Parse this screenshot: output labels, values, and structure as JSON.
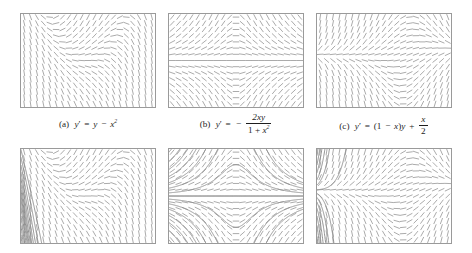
{
  "figure": {
    "background": "#ffffff",
    "panel_border_color": "#9a9a9a",
    "slope_mark_color": "#8c8c8c",
    "solution_curve_color": "#8a8a8a",
    "caption_color": "#1d1d1d",
    "rows": 2,
    "columns": 3
  },
  "panels": [
    {
      "id": "panel-a-field",
      "row": 1,
      "column": 1,
      "label": "(a)",
      "equation_text": "y' = y - x^2",
      "ode": "y-x*x",
      "show_curves": false,
      "x_range": [
        -3,
        3
      ],
      "y_range": [
        -3,
        3
      ],
      "grid": [
        21,
        15
      ]
    },
    {
      "id": "panel-b-field",
      "row": 1,
      "column": 2,
      "label": "(b)",
      "equation_text": "y' = - 2xy / (1 + x^2)",
      "ode": "-2*x*y/(1+x*x)",
      "show_curves": false,
      "x_range": [
        -3,
        3
      ],
      "y_range": [
        -3,
        3
      ],
      "grid": [
        21,
        15
      ]
    },
    {
      "id": "panel-c-field",
      "row": 1,
      "column": 3,
      "label": "(c)",
      "equation_text": "y' = (1 - x)y + x/2",
      "ode": "(1-x)*y+x/2",
      "show_curves": false,
      "x_range": [
        -3,
        3
      ],
      "y_range": [
        -3,
        3
      ],
      "grid": [
        21,
        15
      ]
    },
    {
      "id": "panel-d-curves",
      "row": 2,
      "column": 1,
      "label": "",
      "equation_text": "y' = y - x^2",
      "ode": "y-x*x",
      "show_curves": true,
      "x_range": [
        -3,
        3
      ],
      "y_range": [
        -3,
        3
      ],
      "grid": [
        21,
        15
      ],
      "curve_seeds": [
        2.95,
        2.45,
        1.95,
        1.5,
        1.1,
        0.7,
        0.35,
        0.05,
        -0.3,
        -0.75,
        -1.3,
        -1.9,
        -2.5
      ]
    },
    {
      "id": "panel-e-curves",
      "row": 2,
      "column": 2,
      "label": "",
      "equation_text": "y' = - 2xy / (1 + x^2)",
      "ode": "-2*x*y/(1+x*x)",
      "show_curves": true,
      "x_range": [
        -3,
        3
      ],
      "y_range": [
        -3,
        3
      ],
      "grid": [
        21,
        15
      ],
      "curve_seeds": [
        2.8,
        2.2,
        1.7,
        1.25,
        0.85,
        0.5,
        0.2,
        0.0,
        -0.2,
        -0.5,
        -0.85,
        -1.25,
        -1.7,
        -2.2,
        -2.8
      ]
    },
    {
      "id": "panel-f-curves",
      "row": 2,
      "column": 3,
      "label": "",
      "equation_text": "y' = (1 - x)y + x/2",
      "ode": "(1-x)*y+x/2",
      "show_curves": true,
      "x_range": [
        -3,
        3
      ],
      "y_range": [
        -3,
        3
      ],
      "grid": [
        21,
        15
      ],
      "curve_seeds": [
        2.6,
        2.0,
        1.5,
        1.05,
        0.7,
        0.4,
        0.15,
        -0.1,
        -0.4,
        -0.8,
        -1.3,
        -1.9,
        -2.6
      ]
    }
  ],
  "captions": {
    "a": {
      "label": "(a)",
      "lhs": "y",
      "prime": "′",
      "eq": "=",
      "rhs_1": "y",
      "minus": "−",
      "rhs_var": "x",
      "rhs_exp": "2"
    },
    "b": {
      "label": "(b)",
      "lhs": "y",
      "prime": "′",
      "eq": "=",
      "sign": "−",
      "numerator": "2xy",
      "den_one": "1",
      "den_plus": "+",
      "den_var": "x",
      "den_exp": "2"
    },
    "c": {
      "label": "(c)",
      "lhs": "y",
      "prime": "′",
      "eq": "=",
      "open": "(1",
      "minus": "−",
      "varx": "x",
      "close": ")",
      "vary": "y",
      "plus": "+",
      "frac_num": "x",
      "frac_den": "2"
    }
  }
}
